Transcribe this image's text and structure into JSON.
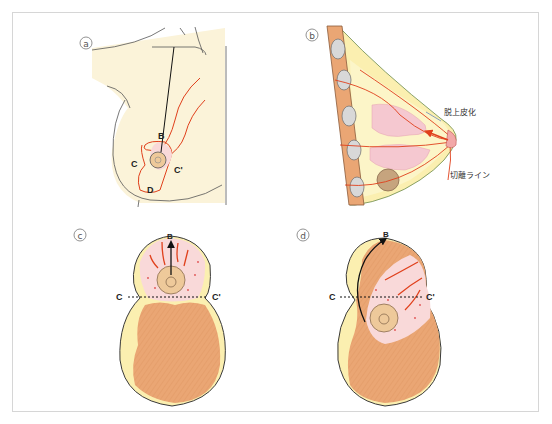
{
  "figure": {
    "panels": [
      {
        "id": "a",
        "tag": "a",
        "labels": {
          "B": "B",
          "C": "C",
          "C_prime": "C'",
          "D": "D"
        }
      },
      {
        "id": "b",
        "tag": "b",
        "annotations": {
          "deepithelialization": "脱上皮化",
          "excision_line": "切離ライン"
        }
      },
      {
        "id": "c",
        "tag": "c",
        "labels": {
          "B": "B",
          "C": "C",
          "C_prime": "C'"
        }
      },
      {
        "id": "d",
        "tag": "d",
        "labels": {
          "B": "B",
          "C": "C",
          "C_prime": "C'"
        }
      }
    ],
    "colors": {
      "skin": "#fbf3d9",
      "fat_yellow": "#fbefb0",
      "muscle_orange": "#eaa674",
      "tissue_pink": "#f9d9d9",
      "vessel_red": "#e0401c",
      "areola": "#eec99a",
      "rib_gray": "#d8d8d8",
      "frame_border": "#d6d6d6",
      "outline": "#3a3a3a"
    }
  }
}
